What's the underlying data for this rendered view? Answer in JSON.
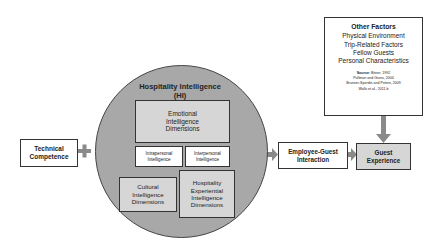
{
  "diagram": {
    "technical_competence": {
      "lines": [
        "Technical",
        "Competence"
      ]
    },
    "plus_symbol": "+",
    "hi_circle": {
      "title_lines": [
        "Hospitality Intelligence",
        "(HI)"
      ],
      "emotional": {
        "lines": [
          "Emotional",
          "Intelligence",
          "Dimensions"
        ]
      },
      "intrapersonal": {
        "lines": [
          "Intrapersonal",
          "Intelligence"
        ]
      },
      "interpersonal": {
        "lines": [
          "Interpersonal",
          "Intelligence"
        ]
      },
      "cultural": {
        "lines": [
          "Cultural",
          "Intelligence",
          "Dimensions"
        ]
      },
      "experiential": {
        "lines": [
          "Hospitality",
          "Experiential",
          "Intelligence",
          "Dimensions"
        ]
      }
    },
    "employee_guest": {
      "lines": [
        "Employee-Guest",
        "Interaction"
      ]
    },
    "guest_experience": {
      "lines": [
        "Guest",
        "Experience"
      ]
    },
    "other_factors": {
      "title": "Other Factors",
      "items": [
        "Physical Environment",
        "Trip-Related Factors",
        "Fellow Guests",
        "Personal Characteristics"
      ],
      "source_label": "Source:",
      "source_lines": [
        "Bitner, 1992",
        "Pullman and Gross, 2004",
        "Brunner-Sperdin and Peters, 2009",
        "Walls et al., 2011 b"
      ]
    },
    "colors": {
      "circle_fill": "#a8a8a8",
      "inner_box_fill": "#d6d6d6",
      "arrow": "#8a8a8a",
      "border": "#333333"
    }
  }
}
